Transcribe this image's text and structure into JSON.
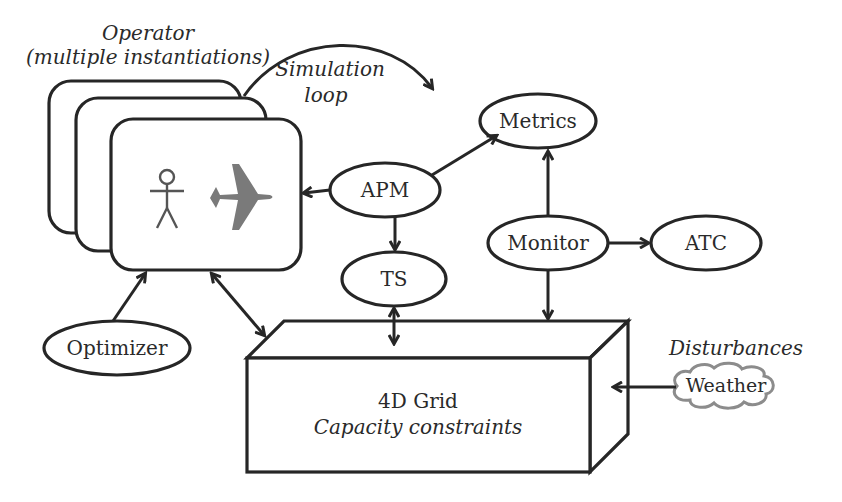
{
  "diagram": {
    "operator_label": "Operator",
    "operator_sublabel": "(multiple instantiations)",
    "simulation_loop_line1": "Simulation",
    "simulation_loop_line2": "loop",
    "nodes": {
      "apm": "APM",
      "metrics": "Metrics",
      "ts": "TS",
      "monitor": "Monitor",
      "atc": "ATC",
      "optimizer": "Optimizer",
      "weather": "Weather"
    },
    "grid_title": "4D Grid",
    "grid_subtitle": "Capacity constraints",
    "disturbances_label": "Disturbances",
    "icons": {
      "operator_person": "stick-figure-icon",
      "operator_aircraft": "airplane-icon"
    },
    "colors": {
      "stroke": "#262626",
      "airplane": "#7a7a7a",
      "cloud": "#8c8c8c",
      "text": "#2a2a2a"
    },
    "edges": [
      {
        "from": "APM",
        "to": "Operator",
        "type": "arrow"
      },
      {
        "from": "APM",
        "to": "Metrics",
        "type": "arrow"
      },
      {
        "from": "APM",
        "to": "TS",
        "type": "arrow"
      },
      {
        "from": "TS",
        "to": "4D Grid",
        "type": "bidirectional"
      },
      {
        "from": "Monitor",
        "to": "Metrics",
        "type": "arrow"
      },
      {
        "from": "Monitor",
        "to": "ATC",
        "type": "arrow"
      },
      {
        "from": "Monitor",
        "to": "4D Grid",
        "type": "arrow"
      },
      {
        "from": "Optimizer",
        "to": "Operator",
        "type": "arrow"
      },
      {
        "from": "Operator",
        "to": "4D Grid",
        "type": "bidirectional"
      },
      {
        "from": "Weather",
        "to": "4D Grid",
        "type": "arrow"
      },
      {
        "from": "Operator",
        "to": "Metrics",
        "type": "curved-loop",
        "label": "Simulation loop"
      }
    ]
  }
}
